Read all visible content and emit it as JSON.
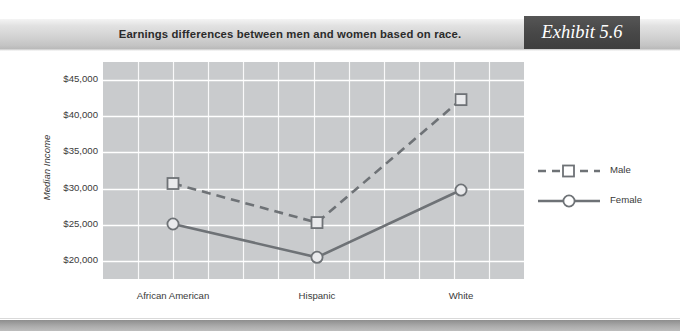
{
  "header": {
    "title": "Earnings differences between men and women based on race.",
    "exhibit_label": "Exhibit 5.6"
  },
  "chart_data": {
    "type": "line",
    "title": "Earnings differences between men and women based on race.",
    "xlabel": "",
    "ylabel": "Median Income",
    "categories": [
      "African American",
      "Hispanic",
      "White"
    ],
    "series": [
      {
        "name": "Male",
        "values": [
          30700,
          25300,
          42300
        ],
        "line_style": "dashed",
        "marker": "square",
        "color": "#6e7276"
      },
      {
        "name": "Female",
        "values": [
          25100,
          20500,
          29800
        ],
        "line_style": "solid",
        "marker": "circle",
        "color": "#6e7276"
      }
    ],
    "ylim": [
      17500,
      47500
    ],
    "yticks": [
      20000,
      25000,
      30000,
      35000,
      40000,
      45000
    ],
    "ytick_labels": [
      "$20,000",
      "$25,000",
      "$30,000",
      "$35,000",
      "$40,000",
      "$45,000"
    ],
    "grid": true,
    "legend_position": "right",
    "plot_background": "#c9cbcd",
    "gridline_color": "#ffffff"
  }
}
